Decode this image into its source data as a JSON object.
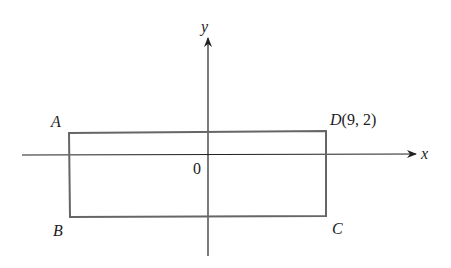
{
  "diagram": {
    "type": "coordinate-plane",
    "axes": {
      "x_label": "x",
      "y_label": "y",
      "origin_label": "0"
    },
    "rectangle": {
      "vertices": [
        {
          "name": "A",
          "label": "A"
        },
        {
          "name": "B",
          "label": "B"
        },
        {
          "name": "C",
          "label": "C"
        },
        {
          "name": "D",
          "label": "D",
          "coords": "(9, 2)"
        }
      ]
    },
    "colors": {
      "axis": "#222222",
      "rectangle": "#666666"
    }
  }
}
